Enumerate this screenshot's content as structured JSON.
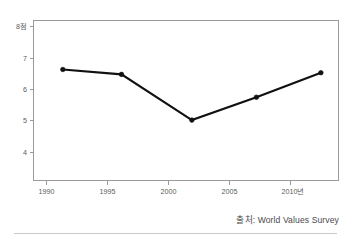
{
  "chart_data": {
    "type": "line",
    "title": "",
    "subtitle": "",
    "xlabel": "",
    "ylabel": "8점",
    "x": [
      1990,
      1995,
      2001,
      2006.5,
      2012
    ],
    "values": [
      6.7,
      6.55,
      5.15,
      5.85,
      6.6
    ],
    "series": [
      {
        "name": "",
        "x": [
          1990,
          1995,
          2001,
          2006.5,
          2012
        ],
        "values": [
          6.7,
          6.55,
          5.15,
          5.85,
          6.6
        ]
      }
    ],
    "x_tick_values": [
      1990,
      1995,
      2000,
      2005,
      2010
    ],
    "x_tick_labels": [
      "1990",
      "1995",
      "2000",
      "2005",
      "2010년"
    ],
    "y_tick_values": [
      4,
      5,
      6,
      7,
      8
    ],
    "y_tick_labels": [
      "4",
      "5",
      "6",
      "7",
      "8점"
    ],
    "xlim": [
      1987.5,
      2013.5
    ],
    "ylim": [
      3.3,
      8.2
    ],
    "grid": false,
    "legend": null,
    "legend_position": "none",
    "line_color": "#111111",
    "marker_color": "#111111",
    "axis_color": "#9a9a9a",
    "background_color": "#ffffff"
  },
  "source": {
    "note": "출처: World Values Survey"
  },
  "axis": {
    "y_label_top": "8점",
    "x_label_last": "2010년"
  }
}
